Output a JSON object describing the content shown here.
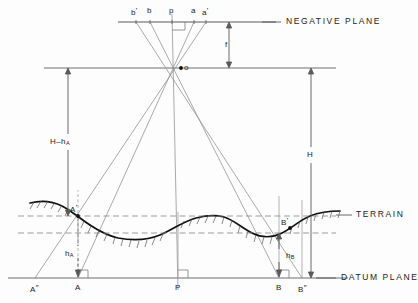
{
  "diagram": {
    "planes": [
      {
        "id": "negative-plane",
        "label": "NEGATIVE  PLANE",
        "y": 22
      },
      {
        "id": "datum-plane",
        "label": "DATUM  PLANE",
        "y": 278
      },
      {
        "id": "terrain",
        "label": "TERRAIN",
        "y": 215
      }
    ],
    "negative_plane_points": [
      {
        "name": "b-prime",
        "text": "b",
        "prime": "'",
        "x": 136
      },
      {
        "name": "b",
        "text": "b",
        "prime": "",
        "x": 150
      },
      {
        "name": "p",
        "text": "p",
        "prime": "",
        "x": 172
      },
      {
        "name": "a",
        "text": "a",
        "prime": "",
        "x": 194
      },
      {
        "name": "a-prime",
        "text": "a",
        "prime": "'",
        "x": 206
      }
    ],
    "perspective_center": {
      "name": "o",
      "label": "o",
      "x": 181,
      "y": 68
    },
    "dimensions": [
      {
        "name": "focal-length",
        "label": "f",
        "x": 229,
        "y": 44
      },
      {
        "name": "height-above-A",
        "label": "H",
        "minus": "–",
        "sub": "h",
        "subsub": "A",
        "x": 62,
        "y": 142
      },
      {
        "name": "flying-height",
        "label": "H",
        "x": 311,
        "y": 155
      },
      {
        "name": "elevation-A",
        "label": "h",
        "sub": "A",
        "x": 72,
        "y": 253
      },
      {
        "name": "elevation-B",
        "label": "h",
        "sub": "B",
        "x": 291,
        "y": 256
      }
    ],
    "ground_points": [
      {
        "name": "A-double-prime",
        "text": "A",
        "prime": "″",
        "x": 35,
        "y": 290
      },
      {
        "name": "A",
        "text": "A",
        "prime": "",
        "x": 78,
        "y": 290
      },
      {
        "name": "P",
        "text": "P",
        "prime": "",
        "x": 178,
        "y": 290
      },
      {
        "name": "B",
        "text": "B",
        "prime": "",
        "x": 279,
        "y": 290
      },
      {
        "name": "B-double-prime",
        "text": "B",
        "prime": "″",
        "x": 302,
        "y": 290
      }
    ],
    "terrain_points": [
      {
        "name": "A-prime-terrain",
        "text": "A",
        "prime": "'",
        "x": 74,
        "y": 205
      },
      {
        "name": "B-prime-terrain",
        "text": "B",
        "prime": "'",
        "x": 286,
        "y": 222
      }
    ],
    "colors": {
      "line": "#6f6f6f",
      "terrain": "#111111",
      "dashed": "#8a8a8a",
      "text": "#222222",
      "background": "#fdfdfd"
    }
  }
}
